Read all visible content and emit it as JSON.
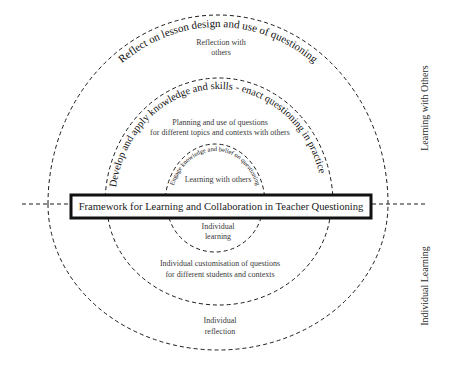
{
  "diagram": {
    "title": "Framework for Learning and Collaboration in Teacher Questioning",
    "side_labels": {
      "upper": "Learning with Others",
      "lower": "Individual Learning"
    },
    "rings": {
      "outer": {
        "arc_label": "Reflect on lesson design and use of questioning",
        "upper_text": [
          "Reflection with",
          "others"
        ],
        "lower_text": [
          "Individual",
          "reflection"
        ]
      },
      "middle": {
        "arc_label": "Develop and apply knowledge and skills - enact questioning in practice",
        "upper_text": [
          "Planning and use of questions",
          "for different topics and contexts with others"
        ],
        "lower_text": [
          "Individual customisation of questions",
          "for different students and contexts"
        ]
      },
      "inner": {
        "arc_label": "Engage knowledge and belief on questioning",
        "upper_text": [
          "Learning with others"
        ],
        "lower_text": [
          "Individual",
          "learning"
        ]
      }
    }
  }
}
